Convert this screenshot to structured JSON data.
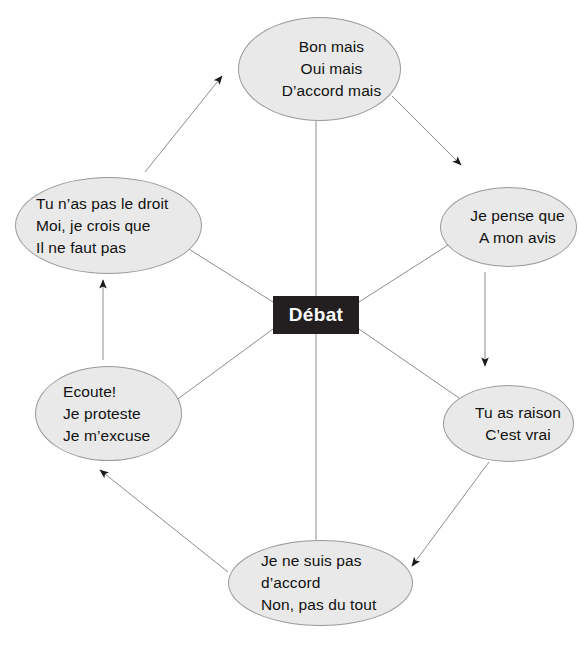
{
  "diagram": {
    "title": "Débat",
    "center": {
      "label": "Débat",
      "fill": "#231f20",
      "text_color": "#ffffff"
    },
    "node_style": {
      "fill": "#e9e9e9",
      "stroke": "#9a9a9a",
      "text_color": "#111111"
    },
    "connector_color": "#8c8c8c",
    "arrowhead_color": "#1a1a1a",
    "nodes": [
      {
        "id": "top",
        "position": "top",
        "align": "center",
        "lines": [
          "Bon mais",
          "Oui mais",
          "D’accord mais"
        ]
      },
      {
        "id": "right-1",
        "position": "right-upper",
        "align": "center",
        "lines": [
          "Je pense que",
          "A mon avis"
        ]
      },
      {
        "id": "right-2",
        "position": "right-lower",
        "align": "center",
        "lines": [
          "Tu as raison",
          "C’est vrai"
        ]
      },
      {
        "id": "bottom",
        "position": "bottom",
        "align": "left",
        "lines": [
          "Je ne suis pas",
          "d’accord",
          "Non, pas du tout"
        ]
      },
      {
        "id": "left-2",
        "position": "left-lower",
        "align": "left",
        "lines": [
          "Ecoute!",
          "Je proteste",
          "Je m’excuse"
        ]
      },
      {
        "id": "left-1",
        "position": "left-upper",
        "align": "left",
        "lines": [
          "Tu n’as pas le droit",
          "Moi, je crois que",
          "Il ne faut pas"
        ]
      }
    ],
    "spokes": [
      {
        "from": "center",
        "to": "top",
        "arrow": false
      },
      {
        "from": "center",
        "to": "right-1",
        "arrow": false
      },
      {
        "from": "center",
        "to": "right-2",
        "arrow": false
      },
      {
        "from": "center",
        "to": "bottom",
        "arrow": false
      },
      {
        "from": "center",
        "to": "left-2",
        "arrow": false
      },
      {
        "from": "center",
        "to": "left-1",
        "arrow": false
      }
    ],
    "flow_arrows": [
      {
        "from": "left-1",
        "to": "top",
        "direction": "up-right"
      },
      {
        "from": "top",
        "to": "right-1",
        "direction": "down-right"
      },
      {
        "from": "right-1",
        "to": "right-2",
        "direction": "down"
      },
      {
        "from": "right-2",
        "to": "bottom",
        "direction": "down-left"
      },
      {
        "from": "bottom",
        "to": "left-2",
        "direction": "up-left"
      },
      {
        "from": "left-2",
        "to": "left-1",
        "direction": "up"
      }
    ]
  }
}
